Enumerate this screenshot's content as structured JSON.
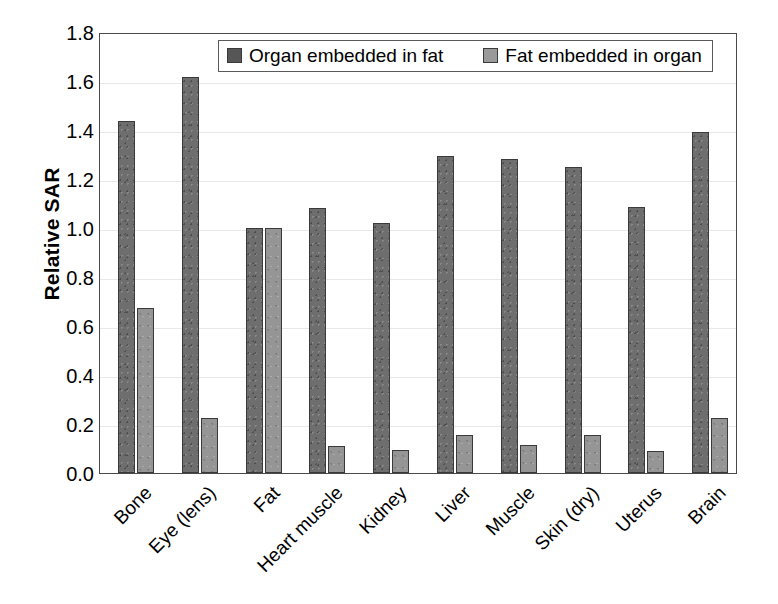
{
  "chart_data": {
    "type": "bar",
    "title": "",
    "xlabel": "",
    "ylabel": "Relative SAR",
    "ylim": [
      0.0,
      1.8
    ],
    "ytick_labels": [
      "1.8",
      "1.6",
      "1.4",
      "1.2",
      "1.0",
      "0.8",
      "0.6",
      "0.4",
      "0.2",
      "0.0"
    ],
    "ytick_values": [
      1.8,
      1.6,
      1.4,
      1.2,
      1.0,
      0.8,
      0.6,
      0.4,
      0.2,
      0.0
    ],
    "grid": true,
    "legend_position": "top-center-inside",
    "categories": [
      "Bone",
      "Eye (lens)",
      "Fat",
      "Heart muscle",
      "Kidney",
      "Liver",
      "Muscle",
      "Skin (dry)",
      "Uterus",
      "Brain"
    ],
    "series": [
      {
        "name": "Organ embedded in fat",
        "color": "#6e6e6e",
        "values": [
          1.435,
          1.615,
          1.0,
          1.08,
          1.02,
          1.295,
          1.28,
          1.25,
          1.085,
          1.39
        ]
      },
      {
        "name": "Fat embedded in organ",
        "color": "#959595",
        "values": [
          0.675,
          0.225,
          1.0,
          0.11,
          0.095,
          0.155,
          0.115,
          0.155,
          0.09,
          0.225
        ]
      }
    ]
  },
  "legend": {
    "entries": [
      {
        "label": "Organ embedded in fat"
      },
      {
        "label": "Fat embedded in organ"
      }
    ]
  },
  "axes": {
    "y_title": "Relative SAR"
  }
}
